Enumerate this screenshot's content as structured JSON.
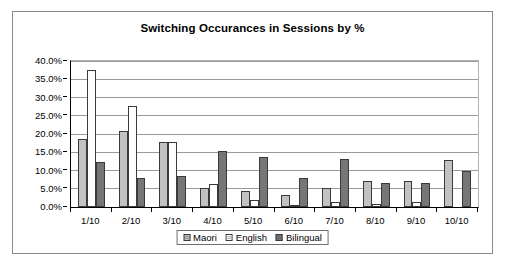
{
  "chart_data": {
    "type": "bar",
    "title": "Switching Occurances in Sessions by %",
    "xlabel": "",
    "ylabel": "",
    "categories": [
      "1/10",
      "2/10",
      "3/10",
      "4/10",
      "5/10",
      "6/10",
      "7/10",
      "8/10",
      "9/10",
      "10/10"
    ],
    "series": [
      {
        "name": "Maori",
        "color": "#c2c2c2",
        "values": [
          18.7,
          20.7,
          17.8,
          5.2,
          4.3,
          3.2,
          5.2,
          7.0,
          7.0,
          13.0
        ]
      },
      {
        "name": "English",
        "color": "#ffffff",
        "values": [
          37.6,
          27.8,
          17.9,
          6.2,
          1.9,
          0.6,
          1.5,
          0.9,
          1.4,
          0.0
        ]
      },
      {
        "name": "Bilingual",
        "color": "#767676",
        "values": [
          12.3,
          8.0,
          8.4,
          15.4,
          13.6,
          8.0,
          13.2,
          6.5,
          6.5,
          10.0
        ]
      }
    ],
    "ylim": [
      0,
      40
    ],
    "y_tick_step": 5,
    "y_tick_labels": [
      "0.0%",
      "5.0%",
      "10.0%",
      "15.0%",
      "20.0%",
      "25.0%",
      "30.0%",
      "35.0%",
      "40.0%"
    ],
    "y_tick_values": [
      0,
      5,
      10,
      15,
      20,
      25,
      30,
      35,
      40
    ],
    "grid": true,
    "legend_position": "bottom",
    "value_suffix": "%"
  },
  "legend": {
    "items": [
      {
        "label": "Maori"
      },
      {
        "label": "English"
      },
      {
        "label": "Bilingual"
      }
    ]
  }
}
